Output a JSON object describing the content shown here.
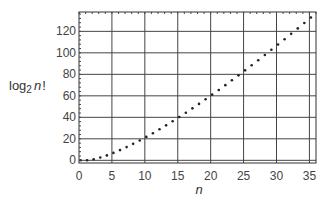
{
  "chart_data": {
    "type": "scatter",
    "title": "",
    "xlabel": "n",
    "ylabel": "log₂ n!",
    "ylabel_parts": {
      "base": "log",
      "sub": "2",
      "var": "n",
      "suffix": "!"
    },
    "xlim": [
      0,
      36
    ],
    "ylim": [
      -2.5,
      138
    ],
    "xticks": [
      0,
      5,
      10,
      15,
      20,
      25,
      30,
      35
    ],
    "yticks": [
      0,
      20,
      40,
      60,
      80,
      100,
      120
    ],
    "grid": true,
    "legend": null,
    "series": [
      {
        "name": "log2(n!)",
        "x": [
          0,
          1,
          2,
          3,
          4,
          5,
          6,
          7,
          8,
          9,
          10,
          11,
          12,
          13,
          14,
          15,
          16,
          17,
          18,
          19,
          20,
          21,
          22,
          23,
          24,
          25,
          26,
          27,
          28,
          29,
          30,
          31,
          32,
          33,
          34,
          35
        ],
        "y": [
          0,
          0,
          1,
          2.58,
          4.58,
          6.91,
          9.49,
          12.3,
          15.3,
          18.47,
          21.79,
          25.25,
          28.84,
          32.54,
          36.35,
          40.25,
          44.25,
          48.34,
          52.51,
          56.76,
          61.08,
          65.47,
          69.93,
          74.46,
          79.05,
          83.69,
          88.39,
          93.15,
          97.96,
          102.82,
          107.73,
          112.68,
          117.68,
          122.72,
          127.81,
          132.94
        ]
      }
    ],
    "plot_box": {
      "left": 79,
      "right": 316,
      "top": 12,
      "bottom": 163
    }
  }
}
